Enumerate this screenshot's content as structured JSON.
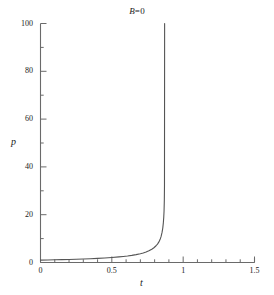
{
  "chart_data": {
    "type": "line",
    "title": "B=0",
    "title_parts": {
      "symbol": "B",
      "rest": "=0"
    },
    "xlabel": "t",
    "ylabel": "p",
    "xlim": [
      0,
      1.5
    ],
    "ylim": [
      0,
      100
    ],
    "grid": false,
    "legend": null,
    "x_major_ticks": [
      0,
      0.5,
      1,
      1.5
    ],
    "x_major_tick_labels": [
      "0",
      "0.5",
      "1",
      "1.5"
    ],
    "x_minor_tick_step": 0.1,
    "y_major_ticks": [
      0,
      20,
      40,
      60,
      80,
      100
    ],
    "y_major_tick_labels": [
      "0",
      "20",
      "40",
      "60",
      "80",
      "100"
    ],
    "y_minor_tick_step": 10,
    "asymptote_x": 0.87,
    "series": [
      {
        "name": "p(t)",
        "color": "#555555",
        "x": [
          0.0,
          0.05,
          0.1,
          0.15,
          0.2,
          0.25,
          0.3,
          0.35,
          0.4,
          0.45,
          0.5,
          0.55,
          0.58,
          0.61,
          0.64,
          0.67,
          0.7,
          0.72,
          0.74,
          0.76,
          0.78,
          0.795,
          0.81,
          0.82,
          0.83,
          0.838,
          0.845,
          0.852,
          0.857,
          0.861,
          0.864,
          0.866,
          0.868,
          0.869,
          0.87
        ],
        "y": [
          1.0,
          1.06,
          1.12,
          1.19,
          1.27,
          1.36,
          1.46,
          1.58,
          1.72,
          1.89,
          2.09,
          2.34,
          2.52,
          2.73,
          2.98,
          3.29,
          3.68,
          4.0,
          4.39,
          4.89,
          5.54,
          6.17,
          7.01,
          7.7,
          8.62,
          9.6,
          10.8,
          12.6,
          14.4,
          16.6,
          19.0,
          21.5,
          26.0,
          32.0,
          100.0
        ]
      }
    ]
  },
  "axes": {
    "y_axis_name": "vertical-axis",
    "x_axis_name": "horizontal-axis"
  }
}
